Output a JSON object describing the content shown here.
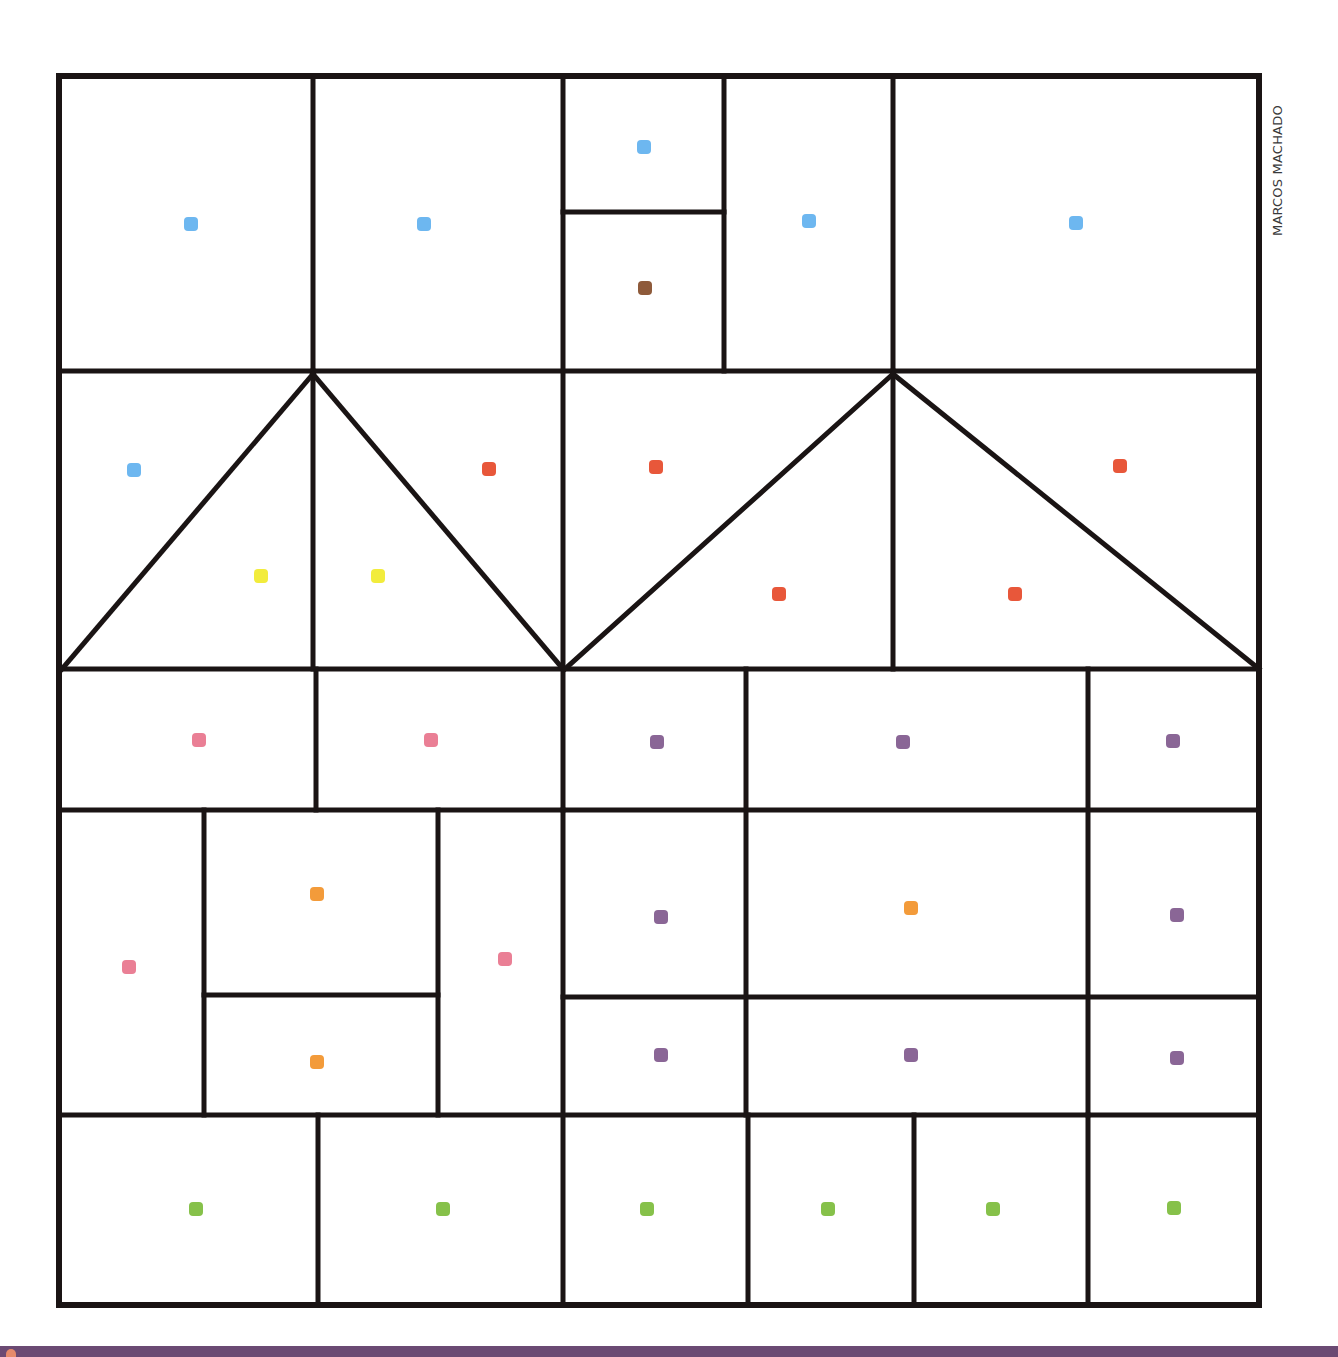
{
  "credit": "MARCOS MACHADO",
  "colors": {
    "line": "#1a1414",
    "blue": "#6db7f0",
    "brown": "#8e5a3a",
    "red": "#e8573a",
    "yellow": "#f2ec3c",
    "pink": "#ea7f95",
    "orange": "#f39b3a",
    "purple": "#8a6696",
    "green": "#86c14a",
    "footer": "#6b4a73"
  },
  "frame": {
    "x1": 59,
    "y1": 76,
    "x2": 1259,
    "y2": 1305
  },
  "lines": [
    [
      59,
      371,
      1259,
      371
    ],
    [
      59,
      669,
      1259,
      669
    ],
    [
      59,
      810,
      563,
      810
    ],
    [
      563,
      810,
      1259,
      810
    ],
    [
      563,
      997,
      1259,
      997
    ],
    [
      59,
      1115,
      1259,
      1115
    ],
    [
      563,
      212,
      724,
      212
    ],
    [
      204,
      995,
      438,
      995
    ],
    [
      313,
      76,
      313,
      371
    ],
    [
      563,
      76,
      563,
      1305
    ],
    [
      724,
      76,
      724,
      371
    ],
    [
      893,
      76,
      893,
      371
    ],
    [
      313,
      371,
      313,
      669
    ],
    [
      893,
      371,
      893,
      669
    ],
    [
      316,
      669,
      316,
      810
    ],
    [
      746,
      669,
      746,
      1115
    ],
    [
      1088,
      669,
      1088,
      1115
    ],
    [
      204,
      810,
      204,
      1115
    ],
    [
      438,
      810,
      438,
      1115
    ],
    [
      318,
      1115,
      318,
      1305
    ],
    [
      748,
      1115,
      748,
      1305
    ],
    [
      914,
      1115,
      914,
      1305
    ],
    [
      1088,
      1115,
      1088,
      1305
    ],
    [
      313,
      374,
      62,
      669
    ],
    [
      313,
      374,
      563,
      669
    ],
    [
      893,
      374,
      565,
      669
    ],
    [
      893,
      374,
      1259,
      669
    ]
  ],
  "dots": [
    {
      "x": 191,
      "y": 224,
      "color": "blue"
    },
    {
      "x": 424,
      "y": 224,
      "color": "blue"
    },
    {
      "x": 644,
      "y": 147,
      "color": "blue"
    },
    {
      "x": 645,
      "y": 288,
      "color": "brown"
    },
    {
      "x": 809,
      "y": 221,
      "color": "blue"
    },
    {
      "x": 1076,
      "y": 223,
      "color": "blue"
    },
    {
      "x": 134,
      "y": 470,
      "color": "blue"
    },
    {
      "x": 261,
      "y": 576,
      "color": "yellow"
    },
    {
      "x": 378,
      "y": 576,
      "color": "yellow"
    },
    {
      "x": 489,
      "y": 469,
      "color": "red"
    },
    {
      "x": 656,
      "y": 467,
      "color": "red"
    },
    {
      "x": 779,
      "y": 594,
      "color": "red"
    },
    {
      "x": 1015,
      "y": 594,
      "color": "red"
    },
    {
      "x": 1120,
      "y": 466,
      "color": "red"
    },
    {
      "x": 199,
      "y": 740,
      "color": "pink"
    },
    {
      "x": 431,
      "y": 740,
      "color": "pink"
    },
    {
      "x": 657,
      "y": 742,
      "color": "purple"
    },
    {
      "x": 903,
      "y": 742,
      "color": "purple"
    },
    {
      "x": 1173,
      "y": 741,
      "color": "purple"
    },
    {
      "x": 129,
      "y": 967,
      "color": "pink"
    },
    {
      "x": 317,
      "y": 894,
      "color": "orange"
    },
    {
      "x": 505,
      "y": 959,
      "color": "pink"
    },
    {
      "x": 317,
      "y": 1062,
      "color": "orange"
    },
    {
      "x": 661,
      "y": 917,
      "color": "purple"
    },
    {
      "x": 911,
      "y": 908,
      "color": "orange"
    },
    {
      "x": 1177,
      "y": 915,
      "color": "purple"
    },
    {
      "x": 661,
      "y": 1055,
      "color": "purple"
    },
    {
      "x": 911,
      "y": 1055,
      "color": "purple"
    },
    {
      "x": 1177,
      "y": 1058,
      "color": "purple"
    },
    {
      "x": 196,
      "y": 1209,
      "color": "green"
    },
    {
      "x": 443,
      "y": 1209,
      "color": "green"
    },
    {
      "x": 647,
      "y": 1209,
      "color": "green"
    },
    {
      "x": 828,
      "y": 1209,
      "color": "green"
    },
    {
      "x": 993,
      "y": 1209,
      "color": "green"
    },
    {
      "x": 1174,
      "y": 1208,
      "color": "green"
    }
  ]
}
